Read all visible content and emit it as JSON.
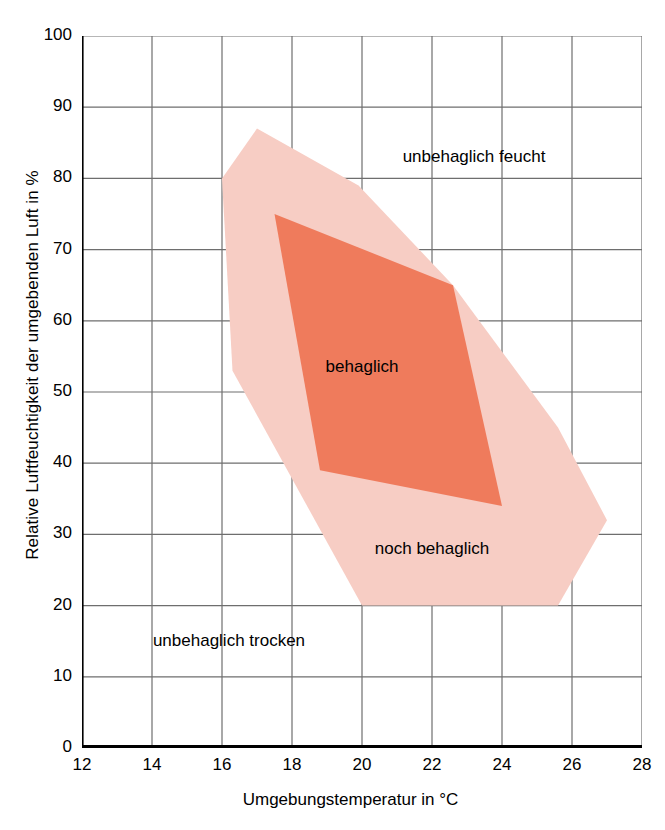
{
  "chart_data": {
    "type": "area",
    "title": "",
    "xlabel": "Umgebungstemperatur in °C",
    "ylabel": "Relative Luftfeuchtigkeit der umgebenden Luft in %",
    "xlim": [
      12,
      28
    ],
    "ylim": [
      0,
      100
    ],
    "xticks": [
      "12",
      "14",
      "16",
      "18",
      "20",
      "22",
      "24",
      "26",
      "28"
    ],
    "yticks": [
      "0",
      "10",
      "20",
      "30",
      "40",
      "50",
      "60",
      "70",
      "80",
      "90",
      "100"
    ],
    "grid": true,
    "legend": "none",
    "colors": {
      "comfort_core": "#ef7b5c",
      "comfort_outer": "#f7cdc4",
      "grid": "#6e6e6e",
      "axis": "#000000",
      "text": "#000000",
      "background": "#ffffff"
    },
    "series": [
      {
        "name": "noch behaglich",
        "fill": "#f7cdc4",
        "points": [
          [
            17.0,
            87.0
          ],
          [
            19.9,
            79.0
          ],
          [
            22.6,
            65.0
          ],
          [
            25.6,
            45.0
          ],
          [
            27.0,
            32.0
          ],
          [
            25.6,
            20.0
          ],
          [
            20.0,
            20.0
          ],
          [
            16.3,
            53.0
          ],
          [
            16.0,
            80.0
          ]
        ]
      },
      {
        "name": "behaglich",
        "fill": "#ef7b5c",
        "points": [
          [
            17.5,
            75.0
          ],
          [
            22.6,
            65.0
          ],
          [
            24.0,
            34.0
          ],
          [
            18.8,
            39.0
          ]
        ]
      }
    ],
    "annotations": [
      {
        "name": "unbehaglich-feucht",
        "text": "unbehaglich feucht",
        "x": 23.2,
        "y": 83.0
      },
      {
        "name": "behaglich",
        "text": "behaglich",
        "x": 20.0,
        "y": 53.5
      },
      {
        "name": "noch-behaglich",
        "text": "noch behaglich",
        "x": 22.0,
        "y": 28.0
      },
      {
        "name": "unbehaglich-trocken",
        "text": "unbehaglich trocken",
        "x": 16.2,
        "y": 15.0
      }
    ]
  }
}
